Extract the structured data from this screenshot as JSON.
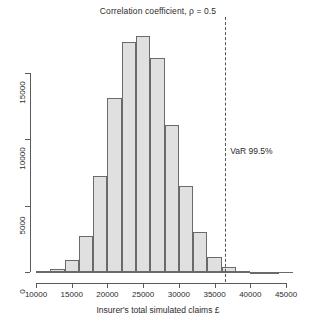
{
  "chart_data": {
    "type": "bar",
    "title": "Correlation coefficient, ρ = 0.5",
    "xlabel": "Insurer's total simulated claims £",
    "ylabel": "",
    "xlim": [
      10000,
      45000
    ],
    "ylim": [
      0,
      17800
    ],
    "grid": false,
    "legend_position": "none",
    "xticks": [
      "10000",
      "15000",
      "20000",
      "25000",
      "30000",
      "35000",
      "40000",
      "45000"
    ],
    "xtick_values": [
      10000,
      15000,
      20000,
      25000,
      30000,
      35000,
      40000,
      45000
    ],
    "yticks": [
      "0",
      "5000",
      "10000",
      "15000"
    ],
    "ytick_values": [
      0,
      5000,
      10000,
      15000
    ],
    "bin_width": 2000,
    "bin_edges": [
      10000,
      12000,
      14000,
      16000,
      18000,
      20000,
      22000,
      24000,
      26000,
      28000,
      30000,
      32000,
      34000,
      36000,
      38000,
      40000,
      42000,
      44000
    ],
    "categories": [
      "10000-12000",
      "12000-14000",
      "14000-16000",
      "16000-18000",
      "18000-20000",
      "20000-22000",
      "22000-24000",
      "24000-26000",
      "26000-28000",
      "28000-30000",
      "30000-32000",
      "32000-34000",
      "34000-36000",
      "36000-38000",
      "38000-40000",
      "40000-42000",
      "42000-44000"
    ],
    "values": [
      60,
      250,
      900,
      2750,
      7200,
      13150,
      17350,
      17800,
      16150,
      11100,
      6500,
      3000,
      1150,
      350,
      90,
      30,
      10
    ],
    "annotations": [
      {
        "label": "VaR 99.5%",
        "x": 36500,
        "style": "dashed vertical line",
        "label_x": 37200,
        "label_y": 9100
      }
    ]
  }
}
